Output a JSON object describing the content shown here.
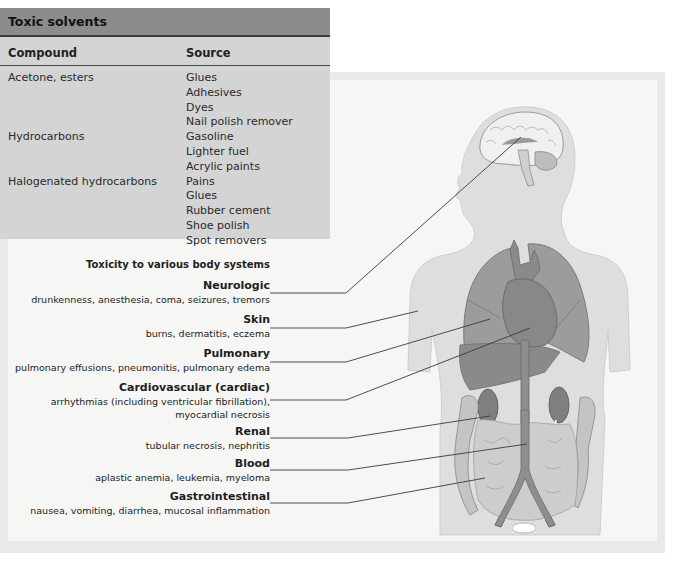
{
  "table": {
    "title": "Toxic solvents",
    "columns": [
      "Compound",
      "Source"
    ],
    "rows": [
      {
        "compound": "Acetone, esters",
        "sources": [
          "Glues",
          "Adhesives",
          "Dyes",
          "Nail polish remover"
        ]
      },
      {
        "compound": "Hydrocarbons",
        "sources": [
          "Gasoline",
          "Lighter fuel",
          "Acrylic paints"
        ]
      },
      {
        "compound": "Halogenated hydrocarbons",
        "sources": [
          "Pains",
          "Glues",
          "Rubber cement",
          "Shoe polish",
          "Spot removers"
        ]
      }
    ]
  },
  "figure": {
    "title": "Toxicity to various body systems",
    "systems": [
      {
        "name": "Neurologic",
        "effects": [
          "drunkenness, anesthesia, coma, seizures, tremors"
        ],
        "target": "brain"
      },
      {
        "name": "Skin",
        "effects": [
          "burns, dermatitis, eczema"
        ],
        "target": "skin"
      },
      {
        "name": "Pulmonary",
        "effects": [
          "pulmonary effusions, pneumonitis, pulmonary edema"
        ],
        "target": "lungs"
      },
      {
        "name": "Cardiovascular (cardiac)",
        "effects": [
          "arrhythmias (including ventricular fibrillation),",
          "myocardial necrosis"
        ],
        "target": "heart"
      },
      {
        "name": "Renal",
        "effects": [
          "tubular necrosis, nephritis"
        ],
        "target": "kidney"
      },
      {
        "name": "Blood",
        "effects": [
          "aplastic anemia, leukemia, myeloma"
        ],
        "target": "aorta"
      },
      {
        "name": "Gastrointestinal",
        "effects": [
          "nausea, vomiting, diarrhea, mucosal inflammation"
        ],
        "target": "intestines"
      }
    ]
  },
  "colors": {
    "table_header": "#8c8c8c",
    "table_body": "#d4d4d4",
    "panel_border": "#e9e9e9",
    "panel_bg": "#f6f6f5",
    "body_silhouette": "#dcdcdc",
    "organ_dark": "#8e8e8e",
    "leader_line": "#3a3a3a"
  }
}
